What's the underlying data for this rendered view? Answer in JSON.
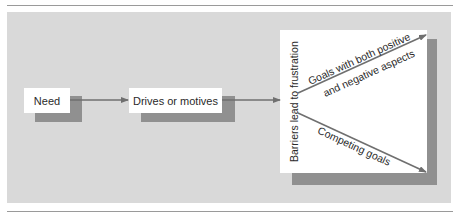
{
  "diagram": {
    "type": "flowchart",
    "nodes": {
      "need": {
        "label": "Need"
      },
      "drives": {
        "label": "Drives or motives"
      },
      "barriers": {
        "label": "Barriers lead to frustration"
      }
    },
    "branches": {
      "upper": {
        "label_line1": "Goals with both positive",
        "label_line2": "and negative aspects"
      },
      "lower": {
        "label": "Competing goals"
      }
    },
    "edges": [
      {
        "from": "Need",
        "to": "Drives or motives"
      },
      {
        "from": "Drives or motives",
        "to": "Barriers lead to frustration"
      },
      {
        "from": "Barriers lead to frustration",
        "to": "Goals with both positive and negative aspects"
      },
      {
        "from": "Barriers lead to frustration",
        "to": "Competing goals"
      }
    ]
  },
  "colors": {
    "panel": "#d9d9d9",
    "box": "#ffffff",
    "shadow": "#909090",
    "arrow": "#6f6f6f",
    "text": "#2a2a2a",
    "rule": "#9a9a9a"
  }
}
